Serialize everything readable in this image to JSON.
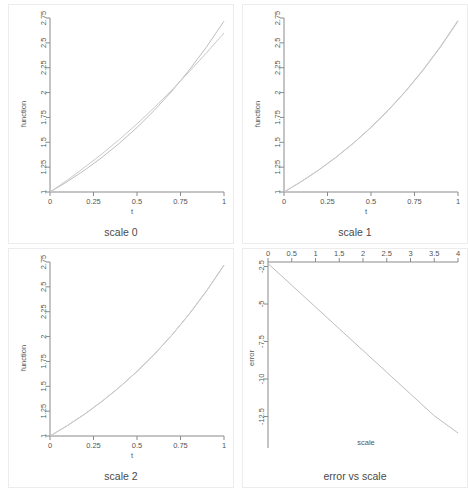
{
  "figure": {
    "background": "#ffffff",
    "curve_color": "#bdbdbd",
    "curve_color_2": "#c9c9c9",
    "axis_color": "#8a8a8a",
    "frame_color": "#ececec"
  },
  "panels": [
    {
      "id": "scale-0",
      "title": "scale 0",
      "xlabel": "t",
      "ylabel": "function",
      "xticks": [
        "0",
        "0.25",
        "0.5",
        "0.75",
        "1"
      ],
      "yticks": [
        "1",
        "1.25",
        "1.5",
        "1.75",
        "2",
        "2.25",
        "2.5",
        "2.75"
      ]
    },
    {
      "id": "scale-1",
      "title": "scale 1",
      "xlabel": "t",
      "ylabel": "function",
      "xticks": [
        "0",
        "0.25",
        "0.5",
        "0.75",
        "1"
      ],
      "yticks": [
        "1",
        "1.25",
        "1.5",
        "1.75",
        "2",
        "2.25",
        "2.5",
        "2.75"
      ]
    },
    {
      "id": "scale-2",
      "title": "scale 2",
      "xlabel": "t",
      "ylabel": "function",
      "xticks": [
        "0",
        "0.25",
        "0.5",
        "0.75",
        "1"
      ],
      "yticks": [
        "1",
        "1.25",
        "1.5",
        "1.75",
        "2",
        "2.25",
        "2.5",
        "2.75"
      ]
    },
    {
      "id": "error-vs-scale",
      "title": "error vs scale",
      "xlabel": "scale",
      "ylabel": "error",
      "xticks": [
        "0",
        "0.5",
        "1",
        "1.5",
        "2",
        "2.5",
        "3",
        "3.5",
        "4"
      ],
      "yticks": [
        "-2.5",
        "-5",
        "-7.5",
        "-10",
        "-12.5"
      ]
    }
  ],
  "chart_data": [
    {
      "type": "line",
      "title": "scale 0",
      "xlabel": "t",
      "ylabel": "function",
      "xlim": [
        0,
        1
      ],
      "ylim": [
        1,
        2.75
      ],
      "xticks": [
        0,
        0.25,
        0.5,
        0.75,
        1
      ],
      "yticks": [
        1,
        1.25,
        1.5,
        1.75,
        2,
        2.25,
        2.5,
        2.75
      ],
      "grid": false,
      "legend": "none",
      "series": [
        {
          "name": "exact",
          "x": [
            0,
            0.1,
            0.2,
            0.3,
            0.4,
            0.5,
            0.6,
            0.7,
            0.8,
            0.9,
            1
          ],
          "values": [
            1.0,
            1.105,
            1.221,
            1.35,
            1.492,
            1.649,
            1.822,
            2.014,
            2.226,
            2.46,
            2.718
          ]
        },
        {
          "name": "approximation",
          "x": [
            0,
            0.1,
            0.2,
            0.3,
            0.4,
            0.5,
            0.6,
            0.7,
            0.8,
            0.9,
            1
          ],
          "values": [
            1.0,
            1.12,
            1.25,
            1.385,
            1.53,
            1.685,
            1.85,
            2.025,
            2.21,
            2.4,
            2.6
          ]
        }
      ]
    },
    {
      "type": "line",
      "title": "scale 1",
      "xlabel": "t",
      "ylabel": "function",
      "xlim": [
        0,
        1
      ],
      "ylim": [
        1,
        2.75
      ],
      "xticks": [
        0,
        0.25,
        0.5,
        0.75,
        1
      ],
      "yticks": [
        1,
        1.25,
        1.5,
        1.75,
        2,
        2.25,
        2.5,
        2.75
      ],
      "grid": false,
      "legend": "none",
      "series": [
        {
          "name": "exact",
          "x": [
            0,
            0.1,
            0.2,
            0.3,
            0.4,
            0.5,
            0.6,
            0.7,
            0.8,
            0.9,
            1
          ],
          "values": [
            1.0,
            1.105,
            1.221,
            1.35,
            1.492,
            1.649,
            1.822,
            2.014,
            2.226,
            2.46,
            2.718
          ]
        },
        {
          "name": "approximation",
          "x": [
            0,
            0.1,
            0.2,
            0.3,
            0.4,
            0.5,
            0.6,
            0.7,
            0.8,
            0.9,
            1
          ],
          "values": [
            1.0,
            1.106,
            1.223,
            1.352,
            1.494,
            1.652,
            1.826,
            2.018,
            2.231,
            2.466,
            2.726
          ]
        }
      ]
    },
    {
      "type": "line",
      "title": "scale 2",
      "xlabel": "t",
      "ylabel": "function",
      "xlim": [
        0,
        1
      ],
      "ylim": [
        1,
        2.75
      ],
      "xticks": [
        0,
        0.25,
        0.5,
        0.75,
        1
      ],
      "yticks": [
        1,
        1.25,
        1.5,
        1.75,
        2,
        2.25,
        2.5,
        2.75
      ],
      "grid": false,
      "legend": "none",
      "series": [
        {
          "name": "exact",
          "x": [
            0,
            0.1,
            0.2,
            0.3,
            0.4,
            0.5,
            0.6,
            0.7,
            0.8,
            0.9,
            1
          ],
          "values": [
            1.0,
            1.105,
            1.221,
            1.35,
            1.492,
            1.649,
            1.822,
            2.014,
            2.226,
            2.46,
            2.718
          ]
        },
        {
          "name": "approximation",
          "x": [
            0,
            0.1,
            0.2,
            0.3,
            0.4,
            0.5,
            0.6,
            0.7,
            0.8,
            0.9,
            1
          ],
          "values": [
            1.0,
            1.105,
            1.221,
            1.35,
            1.492,
            1.649,
            1.822,
            2.014,
            2.226,
            2.46,
            2.718
          ]
        }
      ]
    },
    {
      "type": "line",
      "title": "error vs scale",
      "xlabel": "scale",
      "ylabel": "error",
      "xlim": [
        0,
        4
      ],
      "ylim": [
        -13.8,
        -2.2
      ],
      "xticks": [
        0,
        0.5,
        1,
        1.5,
        2,
        2.5,
        3,
        3.5,
        4
      ],
      "yticks": [
        -2.5,
        -5,
        -7.5,
        -10,
        -12.5
      ],
      "grid": false,
      "legend": "none",
      "xaxis_position": "top",
      "series": [
        {
          "name": "error",
          "x": [
            0,
            0.5,
            1,
            1.5,
            2,
            2.5,
            3,
            3.5,
            4
          ],
          "values": [
            -2.3,
            -3.75,
            -5.2,
            -6.65,
            -8.1,
            -9.55,
            -11.0,
            -12.45,
            -13.6
          ]
        }
      ]
    }
  ]
}
